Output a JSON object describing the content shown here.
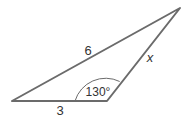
{
  "diagram": {
    "type": "triangle",
    "labels": {
      "long_side": "6",
      "base": "3",
      "right_side": "x",
      "angle": "130°"
    },
    "colors": {
      "stroke": "#6b6b6b",
      "text": "#333333"
    }
  }
}
